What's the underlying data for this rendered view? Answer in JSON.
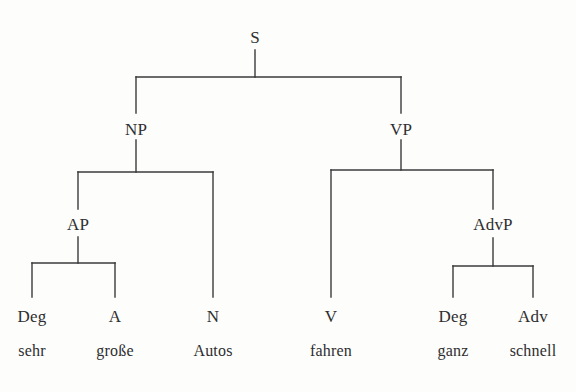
{
  "diagram": {
    "type": "phrase-structure-tree",
    "sentence": "sehr große Autos fahren ganz schnell",
    "language": "German",
    "colors": {
      "background": "#fdfdfb",
      "line": "#3a3a3c",
      "text": "#2e2e30"
    },
    "line_width": 1.4
  },
  "nodes": {
    "root": {
      "label": "S",
      "x": 255,
      "y": 38
    },
    "np": {
      "label": "NP",
      "x": 136,
      "y": 130
    },
    "vp": {
      "label": "VP",
      "x": 401,
      "y": 130
    },
    "ap": {
      "label": "AP",
      "x": 78,
      "y": 225
    },
    "advp": {
      "label": "AdvP",
      "x": 493,
      "y": 225
    }
  },
  "leaves": [
    {
      "category": "Deg",
      "word": "sehr",
      "x": 32
    },
    {
      "category": "A",
      "word": "große",
      "x": 115
    },
    {
      "category": "N",
      "word": "Autos",
      "x": 213
    },
    {
      "category": "V",
      "word": "fahren",
      "x": 331
    },
    {
      "category": "Deg",
      "word": "ganz",
      "x": 453
    },
    {
      "category": "Adv",
      "word": "schnell",
      "x": 533
    }
  ],
  "rows": {
    "category_baseline_y": 322,
    "word_baseline_y": 356
  },
  "edges": [
    {
      "from": "S",
      "to": "NP",
      "kind": "branch"
    },
    {
      "from": "S",
      "to": "VP",
      "kind": "branch"
    },
    {
      "from": "NP",
      "to": "AP",
      "kind": "branch"
    },
    {
      "from": "NP",
      "to": "N",
      "kind": "branch"
    },
    {
      "from": "AP",
      "to": "Deg",
      "kind": "branch"
    },
    {
      "from": "AP",
      "to": "A",
      "kind": "branch"
    },
    {
      "from": "VP",
      "to": "V",
      "kind": "branch"
    },
    {
      "from": "VP",
      "to": "AdvP",
      "kind": "branch"
    },
    {
      "from": "AdvP",
      "to": "Deg",
      "kind": "branch"
    },
    {
      "from": "AdvP",
      "to": "Adv",
      "kind": "branch"
    }
  ]
}
